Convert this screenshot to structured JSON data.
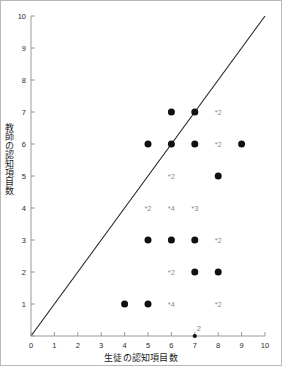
{
  "chart_data": {
    "type": "scatter",
    "title": "",
    "xlabel": "生徒の認知項目数",
    "ylabel": "教師の認知項目数",
    "xlim": [
      0,
      10
    ],
    "ylim": [
      0,
      10
    ],
    "xticks": [
      "0",
      "1",
      "2",
      "3",
      "4",
      "5",
      "6",
      "7",
      "8",
      "9",
      "10"
    ],
    "yticks": [
      "0",
      "1",
      "2",
      "3",
      "4",
      "5",
      "6",
      "7",
      "8",
      "9",
      "10"
    ],
    "grid": false,
    "legend": null,
    "marker_color": "#111111",
    "label_color": "#8d8d8d",
    "axis_color": "#9a9a9a",
    "reference_line": {
      "name": "identity-line",
      "from": [
        0,
        0
      ],
      "to": [
        10,
        10
      ],
      "color": "#222222",
      "note": "y = x diagonal"
    },
    "points": [
      {
        "x": 6,
        "y": 7,
        "count": 1,
        "label": ""
      },
      {
        "x": 7,
        "y": 7,
        "count": 1,
        "label": ""
      },
      {
        "x": 8,
        "y": 7,
        "count": 2,
        "label": "*2"
      },
      {
        "x": 5,
        "y": 6,
        "count": 1,
        "label": ""
      },
      {
        "x": 6,
        "y": 6,
        "count": 1,
        "label": ""
      },
      {
        "x": 7,
        "y": 6,
        "count": 1,
        "label": ""
      },
      {
        "x": 8,
        "y": 6,
        "count": 2,
        "label": "*2"
      },
      {
        "x": 9,
        "y": 6,
        "count": 1,
        "label": ""
      },
      {
        "x": 6,
        "y": 5,
        "count": 2,
        "label": "*2"
      },
      {
        "x": 8,
        "y": 5,
        "count": 1,
        "label": ""
      },
      {
        "x": 5,
        "y": 4,
        "count": 2,
        "label": "*2"
      },
      {
        "x": 6,
        "y": 4,
        "count": 4,
        "label": "*4"
      },
      {
        "x": 7,
        "y": 4,
        "count": 3,
        "label": "*3"
      },
      {
        "x": 5,
        "y": 3,
        "count": 1,
        "label": ""
      },
      {
        "x": 6,
        "y": 3,
        "count": 1,
        "label": ""
      },
      {
        "x": 7,
        "y": 3,
        "count": 1,
        "label": ""
      },
      {
        "x": 8,
        "y": 3,
        "count": 2,
        "label": "*2"
      },
      {
        "x": 6,
        "y": 2,
        "count": 2,
        "label": "*2"
      },
      {
        "x": 7,
        "y": 2,
        "count": 1,
        "label": ""
      },
      {
        "x": 8,
        "y": 2,
        "count": 1,
        "label": ""
      },
      {
        "x": 4,
        "y": 1,
        "count": 1,
        "label": ""
      },
      {
        "x": 5,
        "y": 1,
        "count": 1,
        "label": ""
      },
      {
        "x": 6,
        "y": 1,
        "count": 4,
        "label": "*4"
      },
      {
        "x": 8,
        "y": 1,
        "count": 2,
        "label": "*2"
      },
      {
        "x": 7,
        "y": 0,
        "count": 2,
        "label": "2"
      }
    ]
  }
}
